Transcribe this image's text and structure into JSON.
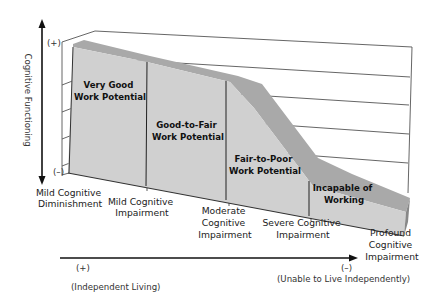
{
  "diagram": {
    "y_axis": {
      "label": "Cognitive Functioning",
      "top_marker": "(+)",
      "bottom_marker": "(–)"
    },
    "x_axis": {
      "left_marker": "(+)",
      "left_label": "(Independent Living)",
      "right_marker": "(–)",
      "right_label": "(Unable to Live Independently)"
    },
    "categories": [
      {
        "line1": "Mild Cognitive",
        "line2": "Diminishment"
      },
      {
        "line1": "Mild Cognitive",
        "line2": "Impairment"
      },
      {
        "line1": "Moderate",
        "line2": "Cognitive",
        "line3": "Impairment"
      },
      {
        "line1": "Severe Cognitive",
        "line2": "Impairment"
      },
      {
        "line1": "Profound",
        "line2": "Cognitive",
        "line3": "Impairment"
      }
    ],
    "regions": [
      {
        "line1": "Very Good",
        "line2": "Work Potential"
      },
      {
        "line1": "Good-to-Fair",
        "line2": "Work Potential"
      },
      {
        "line1": "Fair-to-Poor",
        "line2": "Work Potential"
      },
      {
        "line1": "Incapable of",
        "line2": "Working"
      }
    ],
    "colors": {
      "area_fill": "#cfcfcf",
      "area_top": "#a8a8a8",
      "frame": "#444444",
      "text": "#222222"
    }
  }
}
